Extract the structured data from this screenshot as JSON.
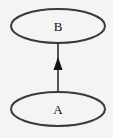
{
  "diagram": {
    "nodes": [
      {
        "id": "B",
        "label": "B",
        "cx": 58,
        "cy": 26,
        "rx": 47,
        "ry": 17
      },
      {
        "id": "A",
        "label": "A",
        "cx": 58,
        "cy": 109,
        "rx": 47,
        "ry": 17
      }
    ],
    "edges": [
      {
        "from": "A",
        "to": "B",
        "arrow": "end"
      }
    ],
    "colors": {
      "background": "#f4f4f4",
      "stroke": "#333333",
      "text": "#111111"
    }
  }
}
